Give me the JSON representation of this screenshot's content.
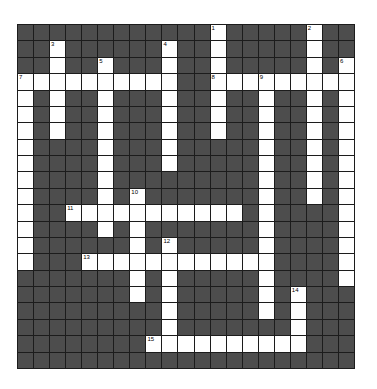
{
  "puzzle": {
    "rows": 21,
    "cols": 21,
    "colors": {
      "block": "#4d4d4d",
      "open": "#ffffff",
      "line": "#1c1c1c"
    },
    "entries": [
      {
        "number": "1",
        "direction": "down",
        "row": 0,
        "col": 12,
        "length": 7
      },
      {
        "number": "2",
        "direction": "down",
        "row": 0,
        "col": 18,
        "length": 11
      },
      {
        "number": "3",
        "direction": "down",
        "row": 1,
        "col": 2,
        "length": 6
      },
      {
        "number": "4",
        "direction": "down",
        "row": 1,
        "col": 9,
        "length": 8
      },
      {
        "number": "5",
        "direction": "down",
        "row": 2,
        "col": 5,
        "length": 11
      },
      {
        "number": "6",
        "direction": "down",
        "row": 2,
        "col": 20,
        "length": 14
      },
      {
        "number": "7",
        "direction": "across",
        "row": 3,
        "col": 0,
        "length": 10
      },
      {
        "number": "7",
        "direction": "down",
        "row": 3,
        "col": 0,
        "length": 12
      },
      {
        "number": "8",
        "direction": "across",
        "row": 3,
        "col": 12,
        "length": 9
      },
      {
        "number": "9",
        "direction": "down",
        "row": 3,
        "col": 15,
        "length": 15
      },
      {
        "number": "10",
        "direction": "down",
        "row": 10,
        "col": 7,
        "length": 7
      },
      {
        "number": "11",
        "direction": "across",
        "row": 11,
        "col": 3,
        "length": 11
      },
      {
        "number": "12",
        "direction": "down",
        "row": 13,
        "col": 9,
        "length": 7
      },
      {
        "number": "13",
        "direction": "across",
        "row": 14,
        "col": 4,
        "length": 12
      },
      {
        "number": "14",
        "direction": "down",
        "row": 16,
        "col": 17,
        "length": 4
      },
      {
        "number": "15",
        "direction": "across",
        "row": 19,
        "col": 8,
        "length": 10
      }
    ]
  }
}
